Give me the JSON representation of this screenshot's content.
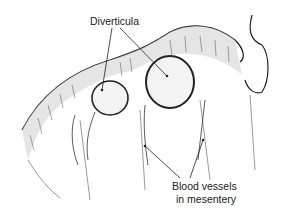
{
  "figure": {
    "labels": {
      "diverticula": "Diverticula",
      "blood_vessels_line1": "Blood vessels",
      "blood_vessels_line2": "in mesentery"
    },
    "colors": {
      "ink": "#1a1a1a",
      "background": "#ffffff"
    }
  }
}
